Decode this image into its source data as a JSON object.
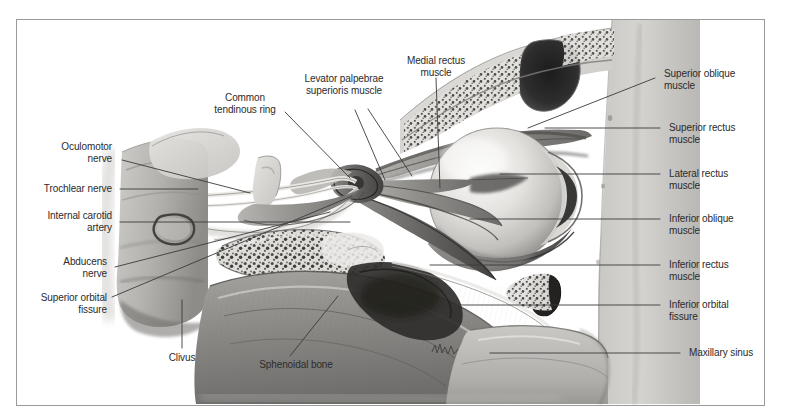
{
  "figure": {
    "type": "anatomical-illustration",
    "border_color": "#9a9a9a",
    "background_color": "#ffffff",
    "leader_line_color": "#3a3a3a",
    "label_text_color": "#2b2b2b"
  },
  "labels": {
    "oculomotor_nerve": "Oculomotor\nnerve",
    "trochlear_nerve": "Trochlear nerve",
    "internal_carotid_artery": "Internal carotid\nartery",
    "abducens_nerve": "Abducens\nnerve",
    "superior_orbital_fissure": "Superior orbital\nfissure",
    "common_tendinous_ring": "Common\ntendinous ring",
    "levator_palpebrae": "Levator palpebrae\nsuperioris muscle",
    "medial_rectus_muscle": "Medial rectus\nmuscle",
    "superior_oblique_muscle": "Superior oblique\nmuscle",
    "superior_rectus_muscle": "Superior rectus\nmuscle",
    "lateral_rectus_muscle": "Lateral rectus\nmuscle",
    "inferior_oblique_muscle": "Inferior oblique\nmuscle",
    "inferior_rectus_muscle": "Inferior rectus\nmuscle",
    "inferior_orbital_fissure": "Inferior orbital\nfissure",
    "maxillary_sinus": "Maxillary sinus",
    "clivus": "Clivus",
    "sphenoidal_bone": "Sphenoidal bone"
  }
}
